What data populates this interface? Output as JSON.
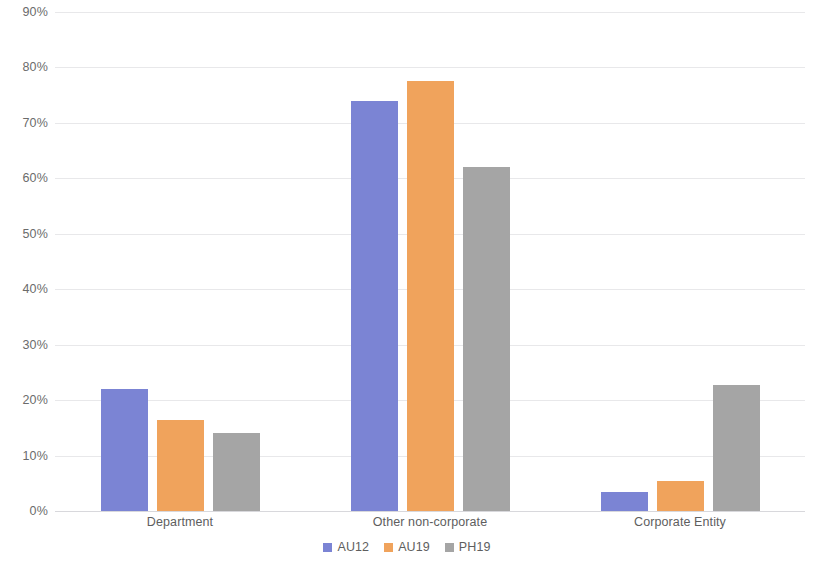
{
  "chart_data": {
    "type": "bar",
    "title": "",
    "subtitle": "",
    "xlabel": "",
    "ylabel": "",
    "categories": [
      "Department",
      "Other non-corporate",
      "Corporate Entity"
    ],
    "series": [
      {
        "name": "AU12",
        "color": "#7b84d4",
        "values": [
          22,
          74,
          3.5
        ]
      },
      {
        "name": "AU19",
        "color": "#f0a35c",
        "values": [
          16.5,
          77.5,
          5.5
        ]
      },
      {
        "name": "PH19",
        "color": "#a5a5a5",
        "values": [
          14,
          62,
          22.8
        ]
      }
    ],
    "ylim": [
      0,
      90
    ],
    "ytick_values": [
      0,
      10,
      20,
      30,
      40,
      50,
      60,
      70,
      80,
      90
    ],
    "ytick_labels": [
      "0%",
      "10%",
      "20%",
      "30%",
      "40%",
      "50%",
      "60%",
      "70%",
      "80%",
      "90%"
    ],
    "value_format": "percent",
    "grid": true,
    "grid_axis": "y",
    "legend": true,
    "legend_position": "bottom",
    "bar_gap_within_group": true,
    "background_color": "#ffffff",
    "gridline_color": "#e8e8ea",
    "axis_text_color": "#5e5e5e"
  }
}
